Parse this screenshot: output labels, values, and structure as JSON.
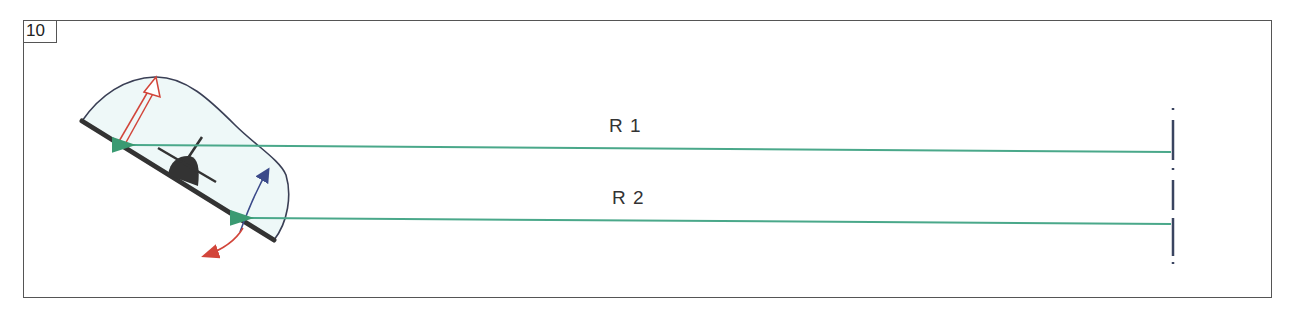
{
  "figure": {
    "number": "10"
  },
  "rays": [
    {
      "id": "R1",
      "label": "R 1"
    },
    {
      "id": "R2",
      "label": "R 2"
    }
  ],
  "colors": {
    "frame": "#555555",
    "ray_green": "#4aa88a",
    "canopy_fill": "#eef8f8",
    "canopy_outline": "#3a3f55",
    "plate": "#333333",
    "red_arrow": "#d2453a",
    "blue_arrow": "#3b4a8a",
    "source_dash": "#3a4460"
  }
}
